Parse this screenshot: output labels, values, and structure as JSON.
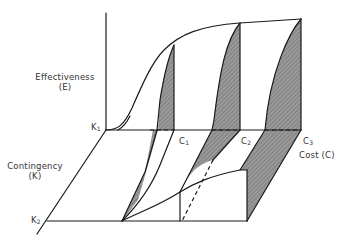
{
  "diagram": {
    "axes": {
      "effectiveness": {
        "line1": "Effectiveness",
        "line2": "(E)"
      },
      "contingency": {
        "line1": "Contingency",
        "line2": "(K)"
      },
      "cost": {
        "label": "Cost (C)"
      }
    },
    "ticks": {
      "k1": {
        "main": "K",
        "sub": "1"
      },
      "k2": {
        "main": "K",
        "sub": "2"
      },
      "c1": {
        "main": "C",
        "sub": "1"
      },
      "c2": {
        "main": "C",
        "sub": "2"
      },
      "c3": {
        "main": "C",
        "sub": "3"
      }
    },
    "colors": {
      "line": "#1a1a1a",
      "shade": "#8c8c8c",
      "text": "#333333",
      "background": "#ffffff"
    }
  }
}
